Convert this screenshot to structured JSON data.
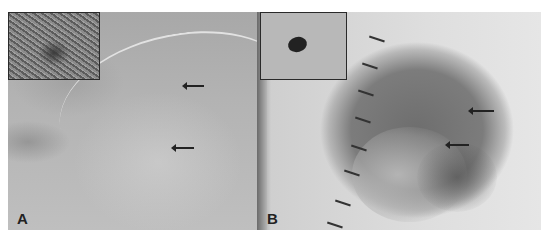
{
  "figure": {
    "panels": [
      {
        "label": "A",
        "description": "Dermoscopic image of a lightly pigmented skin lesion with two arrows indicating pigmented structures; inset shows clinical close-up",
        "inset": "clinical-closeup",
        "arrows": 2
      },
      {
        "label": "B",
        "description": "Dermoscopic image of a dark oval pigmented lesion with scale tick marks on the left and two arrows indicating structures; inset shows small dark mole clinical view",
        "inset": "clinical-mole",
        "arrows": 2,
        "scale_ticks": 8
      }
    ]
  }
}
